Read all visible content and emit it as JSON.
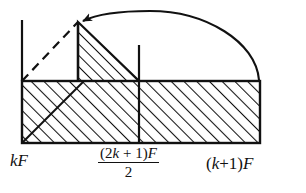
{
  "figure": {
    "background_color": "#ffffff",
    "stroke_color": "#111111"
  },
  "axis_labels": {
    "left": "kF",
    "middle": {
      "numerator_open": "(2",
      "numerator_k": "k",
      "numerator_plus": " + ",
      "numerator_one": "1)",
      "numerator_F": "F",
      "denominator": "2",
      "full_text": "(2k + 1)F / 2"
    },
    "right": {
      "open": "(",
      "k": "k",
      "plus": "+1)",
      "F": "F",
      "full_text": "(k+1)F"
    }
  },
  "geometry": {
    "baseline_y": 81,
    "bottom_y": 143,
    "left_x": 22,
    "apex_x": 78,
    "mid_x": 139,
    "right_x": 260,
    "apex_y": 22,
    "left_tick_top_y": 20,
    "mid_tick_top_y": 45,
    "arc_peak_y": 11
  },
  "elements": {
    "rectangle": "hatched-rectangle",
    "triangle": "hatched-triangle",
    "dashed_line": "dashed-diagonal-line",
    "arrow": "curved-arrow",
    "cross_hatch": "cross-hatch-diagonal",
    "left_tick": "left-vertical-tick",
    "mid_tick": "middle-vertical-tick",
    "apex_tick": "apex-vertical-line"
  }
}
